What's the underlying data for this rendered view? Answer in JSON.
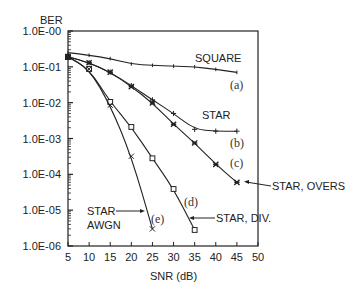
{
  "chart_data": {
    "type": "line",
    "title": "",
    "xlabel": "SNR (dB)",
    "ylabel": "BER",
    "xscale": "linear",
    "yscale": "log",
    "xlim": [
      5,
      50
    ],
    "ylim": [
      1e-06,
      1
    ],
    "grid": false,
    "x_ticks": [
      5,
      10,
      15,
      20,
      25,
      30,
      35,
      40,
      45,
      50
    ],
    "x_tick_labels": [
      "5",
      "10",
      "15",
      "20",
      "25",
      "30",
      "35",
      "40",
      "45",
      "50"
    ],
    "y_ticks": [
      1,
      0.1,
      0.01,
      0.001,
      0.0001,
      1e-05,
      1e-06
    ],
    "y_tick_labels": [
      "1.0E-00",
      "1.0E-01",
      "1.0E-02",
      "1.0E-03",
      "1.0E-04",
      "1.0E-05",
      "1.0E-06"
    ],
    "series": [
      {
        "id": "a",
        "name": "SQUARE",
        "tag": "(a)",
        "marker": "tick",
        "x": [
          5,
          10,
          15,
          20,
          25,
          30,
          35,
          40,
          45
        ],
        "values": [
          0.25,
          0.21,
          0.17,
          0.12,
          0.11,
          0.105,
          0.1,
          0.085,
          0.07
        ]
      },
      {
        "id": "b",
        "name": "STAR",
        "tag": "(b)",
        "marker": "plus",
        "x": [
          5,
          10,
          15,
          20,
          25,
          30,
          35,
          40,
          45
        ],
        "values": [
          0.19,
          0.13,
          0.071,
          0.03,
          0.012,
          0.005,
          0.0018,
          0.0016,
          0.0016
        ]
      },
      {
        "id": "c",
        "name": "STAR, OVERS",
        "tag": "(c)",
        "marker": "star",
        "x": [
          5,
          10,
          15,
          20,
          25,
          30,
          35,
          40,
          45
        ],
        "values": [
          0.19,
          0.13,
          0.071,
          0.028,
          0.0098,
          0.0025,
          0.00075,
          0.00019,
          6e-05
        ]
      },
      {
        "id": "d",
        "name": "STAR, DIV.",
        "tag": "(d)",
        "marker": "square",
        "x": [
          5,
          10,
          15,
          20,
          25,
          30,
          35
        ],
        "values": [
          0.19,
          0.087,
          0.0105,
          0.0021,
          0.00028,
          3.9e-05,
          2.8e-06
        ]
      },
      {
        "id": "e",
        "name": "STAR AWGN",
        "tag": "(e)",
        "marker": "x",
        "x": [
          5,
          10,
          15,
          20,
          25
        ],
        "values": [
          0.19,
          0.087,
          0.0085,
          0.00032,
          3e-06
        ]
      }
    ],
    "annotations": [
      {
        "text": "SQUARE",
        "points_to": "a"
      },
      {
        "text": "STAR",
        "points_to": "b"
      },
      {
        "text": "STAR, OVERS",
        "points_to": "c",
        "arrow": true
      },
      {
        "text": "STAR, DIV.",
        "points_to": "d",
        "arrow": true
      },
      {
        "text": "STAR AWGN",
        "points_to": "e",
        "arrow": true
      }
    ]
  },
  "labels": {
    "ylabel": "BER",
    "xlabel": "SNR (dB)",
    "square": "SQUARE",
    "star": "STAR",
    "star_overs": "STAR, OVERS",
    "star_div": "STAR, DIV.",
    "star_awgn_line1": "STAR",
    "star_awgn_line2": "AWGN",
    "tag_a": "(a)",
    "tag_b": "(b)",
    "tag_c": "(c)",
    "tag_d": "(d)",
    "tag_e": "(e)"
  },
  "colors": {
    "ink": "#222222",
    "background": "#ffffff"
  }
}
